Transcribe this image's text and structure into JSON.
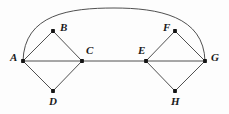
{
  "figure": {
    "width": 229,
    "height": 114,
    "background_color": "#fdfdfd",
    "edge_color": "#3c3c3c",
    "vertex_color": "#141414",
    "label_color": "#1a1a1a"
  },
  "vertices": [
    {
      "id": "A",
      "label": "A",
      "x": 23,
      "y": 61,
      "label_x": 10,
      "label_y": 52,
      "label_pos": "left"
    },
    {
      "id": "B",
      "label": "B",
      "x": 53,
      "y": 31,
      "label_x": 60,
      "label_y": 22,
      "label_pos": "right"
    },
    {
      "id": "C",
      "label": "C",
      "x": 82,
      "y": 61,
      "label_x": 86,
      "label_y": 45,
      "label_pos": "above-right"
    },
    {
      "id": "D",
      "label": "D",
      "x": 53,
      "y": 91,
      "label_x": 49,
      "label_y": 96,
      "label_pos": "below"
    },
    {
      "id": "E",
      "label": "E",
      "x": 146,
      "y": 61,
      "label_x": 138,
      "label_y": 45,
      "label_pos": "above-left"
    },
    {
      "id": "F",
      "label": "F",
      "x": 175,
      "y": 31,
      "label_x": 163,
      "label_y": 22,
      "label_pos": "left"
    },
    {
      "id": "G",
      "label": "G",
      "x": 205,
      "y": 61,
      "label_x": 211,
      "label_y": 52,
      "label_pos": "right"
    },
    {
      "id": "H",
      "label": "H",
      "x": 175,
      "y": 91,
      "label_x": 171,
      "label_y": 96,
      "label_pos": "below"
    }
  ],
  "edges": [
    {
      "id": "A-B",
      "from": "A",
      "to": "B",
      "type": "straight"
    },
    {
      "id": "B-C",
      "from": "B",
      "to": "C",
      "type": "straight"
    },
    {
      "id": "A-D",
      "from": "A",
      "to": "D",
      "type": "straight"
    },
    {
      "id": "D-C",
      "from": "D",
      "to": "C",
      "type": "straight"
    },
    {
      "id": "A-C",
      "from": "A",
      "to": "C",
      "type": "straight"
    },
    {
      "id": "C-E",
      "from": "C",
      "to": "E",
      "type": "straight"
    },
    {
      "id": "E-F",
      "from": "E",
      "to": "F",
      "type": "straight"
    },
    {
      "id": "F-G",
      "from": "F",
      "to": "G",
      "type": "straight"
    },
    {
      "id": "E-H",
      "from": "E",
      "to": "H",
      "type": "straight"
    },
    {
      "id": "H-G",
      "from": "H",
      "to": "G",
      "type": "straight"
    },
    {
      "id": "E-G",
      "from": "E",
      "to": "G",
      "type": "straight"
    },
    {
      "id": "A-G",
      "from": "A",
      "to": "G",
      "type": "arc",
      "path": "M 23 61 C 24 14, 70 8, 114 8 C 158 8, 204 16, 205 61"
    }
  ]
}
